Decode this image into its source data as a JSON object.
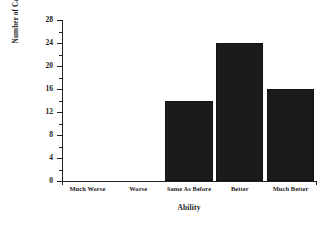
{
  "chart_data": {
    "type": "bar",
    "title": "",
    "categories": [
      "Much Worse",
      "Worse",
      "Same As Before",
      "Better",
      "Much Better"
    ],
    "values": [
      0,
      0,
      14,
      24,
      16
    ],
    "xlabel": "Ability",
    "ylabel": "Number of Cases",
    "ylim": [
      0,
      28
    ],
    "yticks": [
      "0",
      "4",
      "8",
      "12",
      "16",
      "20",
      "24",
      "28"
    ],
    "ytick_step": 4,
    "minor_tick_step": 2,
    "grid": false,
    "legend": null,
    "bar_color": "#1b1b1b",
    "background_color": "#ffffff",
    "axis_color": "#222222"
  }
}
